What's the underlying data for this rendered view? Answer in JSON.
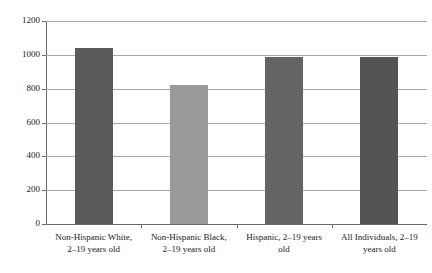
{
  "chart_data": {
    "type": "bar",
    "title": "",
    "subtitle": "",
    "xlabel": "",
    "ylabel": "",
    "ylim": [
      0,
      1200
    ],
    "yticks": [
      0,
      200,
      400,
      600,
      800,
      1000,
      1200
    ],
    "ytick_labels": [
      "0",
      "200",
      "400",
      "600",
      "800",
      "1000",
      "1200"
    ],
    "grid": true,
    "legend": "none",
    "categories": [
      "Non-Hispanic White, 2–19 years old",
      "Non-Hispanic Black, 2–19 years old",
      "Hispanic, 2–19 years old",
      "All Individuals, 2–19 years old"
    ],
    "category_lines": [
      [
        "Non-Hispanic White,",
        "2–19 years old"
      ],
      [
        "Non-Hispanic Black,",
        "2–19 years old"
      ],
      [
        "Hispanic, 2–19 years",
        "old"
      ],
      [
        "All Individuals, 2–19",
        "years old"
      ]
    ],
    "values": [
      1040,
      820,
      985,
      985
    ],
    "bar_colors": [
      "#5a5a5a",
      "#9a9a9a",
      "#646464",
      "#545454"
    ]
  },
  "axis": {
    "grid_color": "#a8a8a8",
    "axis_color": "#6b6b6b",
    "background": "#ffffff",
    "text_color": "#1a1a1a"
  }
}
